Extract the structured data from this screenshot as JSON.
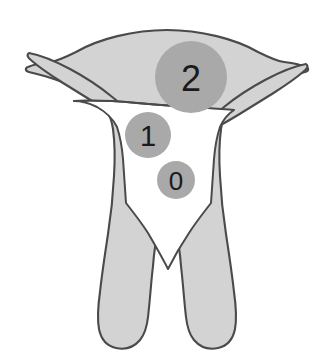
{
  "figure": {
    "background_color": "#ffffff",
    "canvas": {
      "width": 334,
      "height": 363
    }
  },
  "anatomy": {
    "name": "uterus-fallopian-tubes-outline",
    "fill_color": "#d3d3d3",
    "outline_color": "#4a4a4a",
    "outline_width": 2,
    "cavity_color": "#ffffff",
    "parts": [
      {
        "name": "fundus",
        "label": "Fundus"
      },
      {
        "name": "left-fallopian-tube",
        "label": "Left fallopian tube"
      },
      {
        "name": "right-fallopian-tube",
        "label": "Right fallopian tube"
      },
      {
        "name": "uterine-body-left-wall",
        "label": "Left uterine wall"
      },
      {
        "name": "uterine-body-right-wall",
        "label": "Right uterine wall"
      },
      {
        "name": "uterine-cavity",
        "label": "Uterine cavity"
      }
    ]
  },
  "markers": [
    {
      "id": "marker-2",
      "label": "2",
      "cx": 191,
      "cy": 77,
      "r": 36,
      "fill": "#a9a9a9",
      "text_color": "#1a1a1a"
    },
    {
      "id": "marker-1",
      "label": "1",
      "cx": 148,
      "cy": 135,
      "r": 23,
      "fill": "#a9a9a9",
      "text_color": "#1a1a1a"
    },
    {
      "id": "marker-0",
      "label": "0",
      "cx": 176,
      "cy": 180,
      "r": 19,
      "fill": "#a9a9a9",
      "text_color": "#1a1a1a"
    }
  ]
}
